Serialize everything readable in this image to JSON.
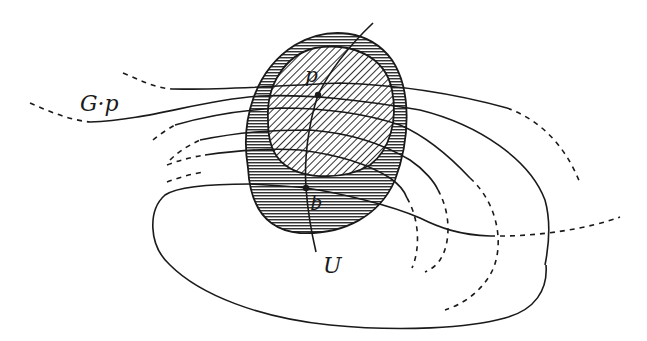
{
  "figure": {
    "colors": {
      "ink": "#1a1a1a",
      "background": "#ffffff"
    },
    "labels": {
      "orbit": "G·p",
      "point_p": "p",
      "point_q": "q",
      "slice": "U"
    },
    "regions": {
      "outer_neighborhood": {
        "fill_pattern": "horizontal-hatching"
      },
      "inner_neighborhood": {
        "fill_pattern": "diagonal-hatching"
      }
    },
    "points": [
      {
        "name": "p",
        "x": 318,
        "y": 95
      },
      {
        "name": "q",
        "x": 306,
        "y": 188
      }
    ]
  }
}
